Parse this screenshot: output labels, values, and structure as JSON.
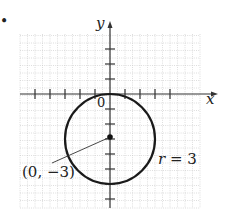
{
  "figure": {
    "bullet": "•",
    "axes": {
      "x_label": "x",
      "y_label": "y",
      "origin_label": "0",
      "origin_px": [
        110,
        94
      ],
      "unit_px": 15,
      "x_ticks": [
        -5,
        -4,
        -3,
        -2,
        -1,
        1,
        2,
        3,
        4
      ],
      "y_ticks": [
        3,
        2,
        1,
        -1,
        -2,
        -3,
        -4,
        -5,
        -6,
        -7
      ]
    },
    "grid": {
      "x_range": [
        -6,
        6
      ],
      "y_range": [
        -7.6,
        4
      ],
      "minor_step": 0.5,
      "color": "#c8c8c8"
    },
    "circle": {
      "center": [
        0,
        -3
      ],
      "radius": 3,
      "color": "#1a1a1a"
    },
    "annotations": {
      "center_label": "(0, −3)",
      "radius_label": "r = 3"
    }
  }
}
